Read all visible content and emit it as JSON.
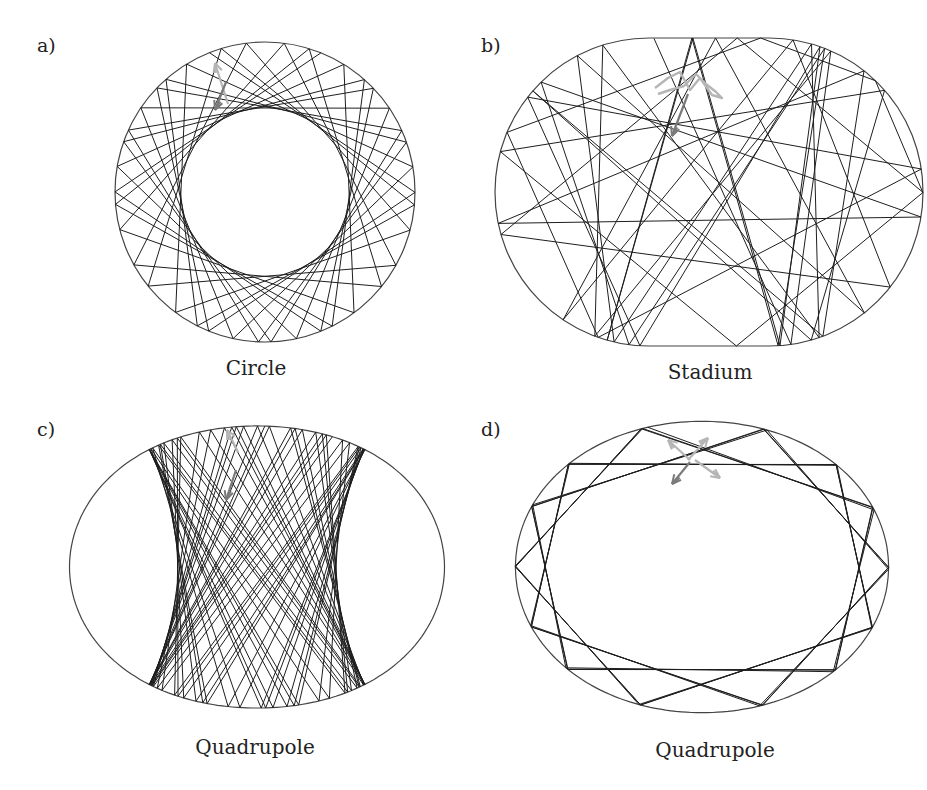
{
  "figure": {
    "panels": [
      {
        "id": "a",
        "label": "a)",
        "caption": "Circle",
        "billiard": "circle",
        "dynamics": "regular (whispering-gallery with circular caustic)"
      },
      {
        "id": "b",
        "label": "b)",
        "caption": "Stadium",
        "billiard": "stadium",
        "dynamics": "chaotic"
      },
      {
        "id": "c",
        "label": "c)",
        "caption": "Quadrupole",
        "billiard": "quadrupole",
        "dynamics": "regular (bouncing-ball with hyperbolic caustics)"
      },
      {
        "id": "d",
        "label": "d)",
        "caption": "Quadrupole",
        "billiard": "quadrupole",
        "dynamics": "chaotic"
      }
    ],
    "colors": {
      "boundary": "#444444",
      "trajectory": "#1e1e1e",
      "initial_arrow_light": "#b5b5b5",
      "initial_arrow_dark": "#7a7a7a"
    }
  }
}
